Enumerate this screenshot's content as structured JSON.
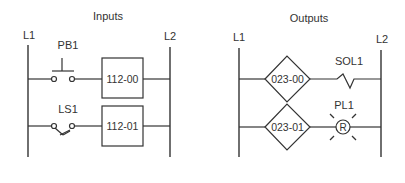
{
  "inputs": {
    "title": "Inputs",
    "left_rail": "L1",
    "right_rail": "L2",
    "rungs": [
      {
        "device": "PB1",
        "device_type": "pushbutton-normally-open",
        "address": "112-00"
      },
      {
        "device": "LS1",
        "device_type": "limit-switch-normally-open",
        "address": "112-01"
      }
    ]
  },
  "outputs": {
    "title": "Outputs",
    "left_rail": "L1",
    "right_rail": "L2",
    "rungs": [
      {
        "device": "SOL1",
        "device_type": "solenoid",
        "address": "023-00"
      },
      {
        "device": "PL1",
        "device_type": "pilot-light",
        "address": "023-01",
        "lamp_letter": "R"
      }
    ]
  }
}
